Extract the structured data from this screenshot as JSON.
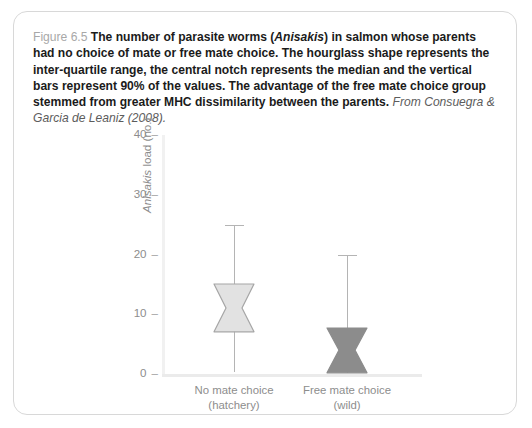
{
  "figure": {
    "number": "Figure 6.5",
    "caption_main": "The number of parasite worms (",
    "caption_species": "Anisakis",
    "caption_main2": ") in salmon whose parents had no choice of mate or free mate choice. The hourglass shape represents the inter-quartile range, the central notch represents the median and the vertical bars represent 90% of the values. The advantage of the free mate choice group stemmed from greater MHC dissimilarity between the parents.",
    "citation": "From Consuegra & Garcia de Leaniz (2008)."
  },
  "chart_data": {
    "type": "box",
    "title": "",
    "xlabel": "",
    "ylabel_italic": "Anisakis",
    "ylabel_rest": " load (no.)",
    "ylim": [
      0,
      40
    ],
    "yticks": [
      0,
      10,
      20,
      30,
      40
    ],
    "ytick_labels": [
      "0",
      "10",
      "20",
      "30",
      "40"
    ],
    "tick_dash": "–",
    "grid": false,
    "legend": "none",
    "categories": [
      {
        "line1": "No mate choice",
        "line2": "(hatchery)"
      },
      {
        "line1": "Free mate choice",
        "line2": "(wild)"
      }
    ],
    "boxes": [
      {
        "name": "No mate choice (hatchery)",
        "q1": 7.0,
        "median": 11.0,
        "q3": 15.0,
        "whisker_low": 0.3,
        "whisker_high": 25.0,
        "notch_inset": 0.3,
        "fill": "#e2e2e2",
        "stroke": "#a6a6a6"
      },
      {
        "name": "Free mate choice (wild)",
        "q1": 0.2,
        "median": 4.0,
        "q3": 7.7,
        "whisker_low": 0.2,
        "whisker_high": 20.0,
        "notch_inset": 0.3,
        "fill": "#8c8c8c",
        "stroke": "#8c8c8c"
      }
    ]
  },
  "colors": {
    "panel_border": "#d8d8d8",
    "axis": "#efefef",
    "tick_text": "#8d8d8d",
    "caption_text": "#1b1b1b",
    "figno_text": "#a8a8a8"
  }
}
